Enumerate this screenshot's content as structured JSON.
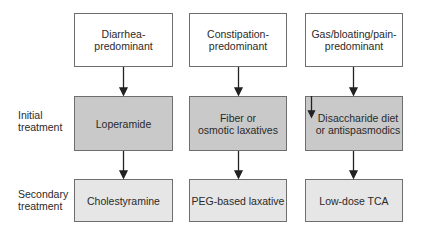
{
  "row_labels": {
    "initial": "Initial\ntreatment",
    "secondary": "Secondary\ntreatment"
  },
  "columns": [
    {
      "subtype": "Diarrhea-\npredominant",
      "initial": "Loperamide",
      "secondary": "Cholestyramine"
    },
    {
      "subtype": "Constipation-\npredominant",
      "initial": "Fiber or\nosmotic laxatives",
      "secondary": "PEG-based laxative"
    },
    {
      "subtype": "Gas/bloating/pain-\npredominant",
      "initial": "Disaccharide diet\nor antispasmodics",
      "secondary": "Low-dose TCA"
    }
  ],
  "colors": {
    "top_box": "#ffffff",
    "initial_box": "#c9c9c9",
    "secondary_box": "#e6e6e6",
    "border": "#6e6e6e",
    "arrow": "#222222"
  }
}
